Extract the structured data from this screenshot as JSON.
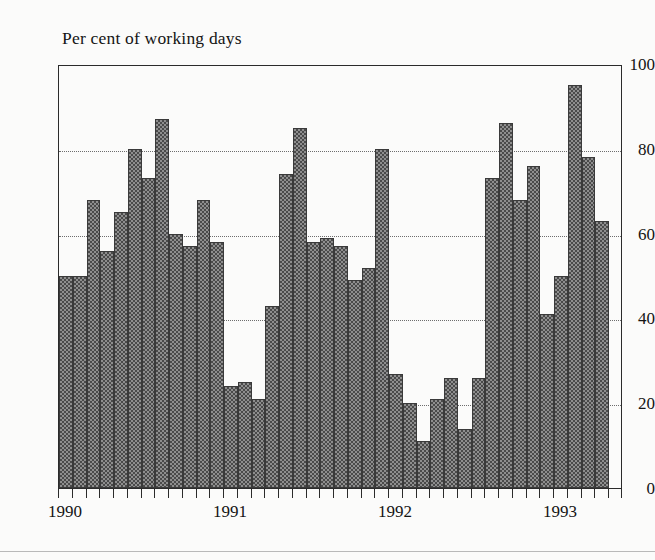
{
  "chart_data": {
    "type": "bar",
    "title": "Per cent of working days",
    "xlabel": "",
    "ylabel": "",
    "ylim": [
      0,
      100
    ],
    "yticks": [
      0,
      20,
      40,
      60,
      80,
      100
    ],
    "ytick_labels": [
      "0",
      "20",
      "40",
      "60",
      "80",
      "100"
    ],
    "gridlines": [
      20,
      40,
      60,
      80
    ],
    "grid": true,
    "grid_style": "dotted",
    "legend": null,
    "legend_position": "none",
    "x_axis_tick_count": 41,
    "year_labels": [
      {
        "label": "1990",
        "index": 0
      },
      {
        "label": "1991",
        "index": 12
      },
      {
        "label": "1992",
        "index": 24
      },
      {
        "label": "1993",
        "index": 36
      }
    ],
    "categories": [
      "1990-01",
      "1990-02",
      "1990-03",
      "1990-04",
      "1990-05",
      "1990-06",
      "1990-07",
      "1990-08",
      "1990-09",
      "1990-10",
      "1990-11",
      "1990-12",
      "1991-01",
      "1991-02",
      "1991-03",
      "1991-04",
      "1991-05",
      "1991-06",
      "1991-07",
      "1991-08",
      "1991-09",
      "1991-10",
      "1991-11",
      "1991-12",
      "1992-01",
      "1992-02",
      "1992-03",
      "1992-04",
      "1992-05",
      "1992-06",
      "1992-07",
      "1992-08",
      "1992-09",
      "1992-10",
      "1992-11",
      "1992-12",
      "1993-01",
      "1993-02",
      "1993-03",
      "1993-04",
      "1993-05"
    ],
    "values": [
      50,
      50,
      68,
      56,
      65,
      80,
      73,
      87,
      60,
      57,
      68,
      58,
      24,
      25,
      21,
      43,
      74,
      85,
      58,
      59,
      57,
      49,
      52,
      80,
      27,
      20,
      11,
      21,
      26,
      14,
      26,
      73,
      86,
      68,
      76,
      41,
      50,
      95,
      78,
      63,
      0
    ],
    "bar_color": "#8e8e8e",
    "bar_edge_color": "#3a3a3a",
    "axis_color": "#2b2b2b",
    "background_color": "#fbfbfa"
  }
}
